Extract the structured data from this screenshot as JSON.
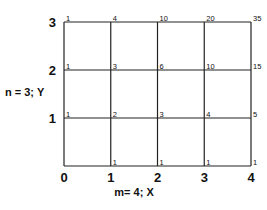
{
  "diagram": {
    "m": 4,
    "n": 3,
    "x_axis_label": "m= 4; X",
    "y_axis_label": "n = 3; Y",
    "x_ticks": [
      "0",
      "1",
      "2",
      "3",
      "4"
    ],
    "y_ticks": [
      "1",
      "2",
      "3"
    ],
    "node_values": {
      "row_y3": [
        "1",
        "4",
        "10",
        "20",
        "35"
      ],
      "row_y2": [
        "1",
        "3",
        "6",
        "10",
        "15"
      ],
      "row_y1": [
        "1",
        "2",
        "3",
        "4",
        "5"
      ],
      "row_y0": [
        "",
        "1",
        "1",
        "1",
        "1"
      ]
    },
    "line_color": "#222222"
  }
}
